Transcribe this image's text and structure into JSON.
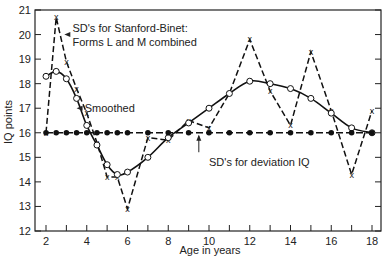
{
  "chart_data": {
    "type": "line",
    "title": "",
    "xlabel": "Age in years",
    "ylabel": "IQ points",
    "xlim": [
      1.6,
      18.4
    ],
    "ylim": [
      12,
      21
    ],
    "xticks": [
      2,
      4,
      6,
      8,
      10,
      12,
      14,
      16,
      18
    ],
    "xminor": [
      3,
      5,
      7,
      9,
      11,
      13,
      15,
      17
    ],
    "yticks": [
      12,
      13,
      14,
      15,
      16,
      17,
      18,
      19,
      20,
      21
    ],
    "grid": false,
    "series": [
      {
        "name": "SD's for Stanford-Binet: Forms L and M combined",
        "style": "dashed",
        "marker": "x",
        "x": [
          2,
          2.5,
          3,
          3.5,
          4,
          4.5,
          5,
          5.5,
          6,
          7,
          8,
          9,
          10,
          11,
          12,
          13,
          14,
          15,
          16,
          17,
          18
        ],
        "y": [
          16.0,
          20.7,
          18.9,
          17.8,
          16.8,
          15.6,
          14.2,
          14.2,
          12.9,
          15.8,
          15.7,
          16.5,
          16.2,
          17.6,
          19.8,
          17.7,
          16.3,
          19.3,
          16.9,
          14.3,
          16.9
        ]
      },
      {
        "name": "Smoothed",
        "style": "solid",
        "marker": "open-circle",
        "x": [
          2,
          2.5,
          3,
          3.5,
          4,
          4.5,
          5,
          5.5,
          6,
          7,
          8,
          9,
          10,
          11,
          12,
          13,
          14,
          15,
          16,
          17,
          18
        ],
        "y": [
          18.3,
          18.5,
          18.2,
          17.4,
          16.3,
          15.5,
          14.7,
          14.3,
          14.4,
          15.0,
          15.8,
          16.4,
          17.0,
          17.6,
          18.1,
          18.0,
          17.8,
          17.4,
          16.8,
          16.2,
          16.0
        ]
      },
      {
        "name": "SD's for deviation IQ",
        "style": "dash-dot",
        "marker": "filled-circle",
        "x": [
          2,
          2.5,
          3,
          3.5,
          4,
          4.5,
          5,
          5.5,
          6,
          7,
          8,
          9,
          10,
          11,
          12,
          13,
          14,
          15,
          16,
          17,
          18
        ],
        "y": [
          16,
          16,
          16,
          16,
          16,
          16,
          16,
          16,
          16,
          16,
          16,
          16,
          16,
          16,
          16,
          16,
          16,
          16,
          16,
          16,
          16
        ]
      }
    ],
    "annotations": [
      {
        "text_lines": [
          "SD's for Stanford-Binet:",
          "Forms L and M combined"
        ],
        "arrow_to": [
          2.9,
          20.0
        ],
        "text_at": [
          3.3,
          20.0
        ]
      },
      {
        "text_lines": [
          "Smoothed"
        ],
        "arrow_to": [
          3.5,
          17.0
        ],
        "text_at": [
          3.9,
          17.0
        ]
      },
      {
        "text_lines": [
          "SD's for deviation IQ"
        ],
        "arrow_to": [
          9.5,
          16.0
        ],
        "text_at": [
          10.0,
          14.8
        ]
      }
    ]
  }
}
